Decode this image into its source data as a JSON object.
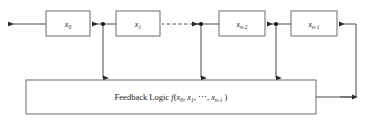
{
  "diagram": {
    "type": "linear-feedback-shift-register",
    "registers": [
      {
        "id": "x0",
        "base": "x",
        "sub": "0",
        "x": 46,
        "y": 11,
        "w": 44,
        "h": 25
      },
      {
        "id": "x1",
        "base": "x",
        "sub": "1",
        "x": 116,
        "y": 11,
        "w": 44,
        "h": 25
      },
      {
        "id": "xn2",
        "base": "x",
        "sub": "n-2",
        "x": 219,
        "y": 11,
        "w": 46,
        "h": 25
      },
      {
        "id": "xn1",
        "base": "x",
        "sub": "n-1",
        "x": 291,
        "y": 11,
        "w": 46,
        "h": 25
      }
    ],
    "feedback_box": {
      "x": 26,
      "y": 80,
      "w": 290,
      "h": 34,
      "label_prefix": "Feedback  Logic ",
      "func_name": "f",
      "func_args": "(x0, x1, ⋯, xn-1)"
    },
    "taps": [
      {
        "id": "tap-1",
        "x": 103
      },
      {
        "id": "tap-2",
        "x": 201
      },
      {
        "id": "tap-3",
        "x": 276
      }
    ],
    "wire_y": 24,
    "dashed_segment": {
      "x1": 161,
      "x2": 199
    },
    "output_arrow": {
      "x1": 46,
      "x2": 6,
      "y": 24
    },
    "feedback_return": {
      "exit_x": 316,
      "exit_y": 97,
      "right_x": 356,
      "enter_x": 337,
      "enter_y": 24
    },
    "colors": {
      "stroke": "#4a4a4a",
      "box_border": "#6b6b6b",
      "text": "#1a1a1a",
      "background": "#ffffff"
    }
  }
}
